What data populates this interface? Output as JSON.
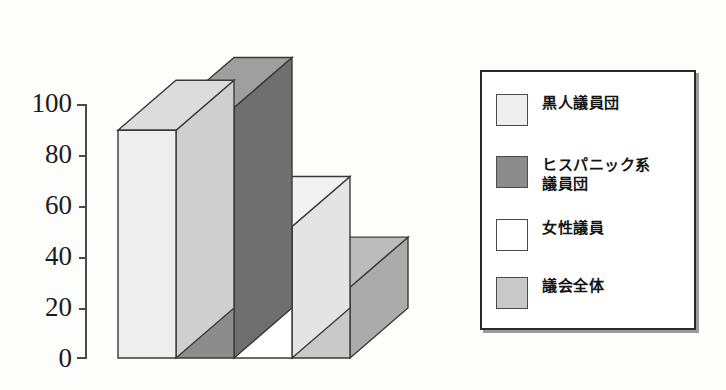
{
  "chart_data": {
    "type": "bar",
    "title": "",
    "xlabel": "",
    "ylabel": "",
    "ylim": [
      0,
      100
    ],
    "ytick_labels": [
      "100",
      "80",
      "60",
      "40",
      "20",
      "0"
    ],
    "yticks": [
      100,
      80,
      60,
      40,
      20,
      0
    ],
    "grid": false,
    "legend_position": "right",
    "categories": [
      "黒人議員団",
      "ヒスパニック系議員団",
      "女性議員",
      "議会全体"
    ],
    "values": [
      90,
      99,
      52,
      28
    ],
    "series": [
      {
        "name": "割合",
        "values": [
          90,
          99,
          52,
          28
        ]
      }
    ],
    "bars": [
      {
        "label": "黒人議員団",
        "value": 90,
        "front_color": "#eeeeee",
        "top_color": "#dcdcdc",
        "side_color": "#cfcfcf"
      },
      {
        "label": "ヒスパニック系議員団",
        "value": 99,
        "front_color": "#8c8c8c",
        "top_color": "#9f9f9f",
        "side_color": "#6f6f6f"
      },
      {
        "label": "女性議員",
        "value": 52,
        "front_color": "#ffffff",
        "top_color": "#f2f2f2",
        "side_color": "#e4e4e4"
      },
      {
        "label": "議会全体",
        "value": 28,
        "front_color": "#c9c9c9",
        "top_color": "#bcbcbc",
        "side_color": "#ababab"
      }
    ],
    "annotations": []
  },
  "legend": {
    "items": [
      {
        "label": "黒人議員団",
        "color": "#eeeeee"
      },
      {
        "label": "ヒスパニック系\n議員団",
        "color": "#8c8c8c"
      },
      {
        "label": "女性議員",
        "color": "#ffffff"
      },
      {
        "label": "議会全体",
        "color": "#c9c9c9"
      }
    ]
  },
  "axis": {
    "tick_0": "0",
    "tick_20": "20",
    "tick_40": "40",
    "tick_60": "60",
    "tick_80": "80",
    "tick_100": "100"
  }
}
